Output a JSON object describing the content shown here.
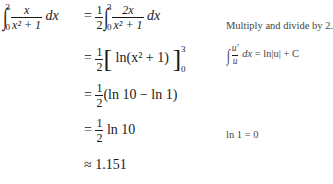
{
  "lines": [
    {
      "lhs": {
        "integral": {
          "lower": "0",
          "upper": "3",
          "numerator": "x",
          "denominator": "x² + 1",
          "differential": "dx"
        }
      },
      "rhs": {
        "relation": "=",
        "coef": {
          "numerator": "1",
          "denominator": "2"
        },
        "integral": {
          "lower": "0",
          "upper": "3",
          "numerator": "2x",
          "denominator": "x² + 1",
          "differential": "dx"
        }
      },
      "note": "Multiply and divide by 2."
    },
    {
      "rhs": {
        "relation": "=",
        "coef": {
          "numerator": "1",
          "denominator": "2"
        },
        "expr": "ln(x² + 1)",
        "lower": "0",
        "upper": "3"
      },
      "note": {
        "integral_num": "u′",
        "integral_den": "u",
        "differential": "dx",
        "result": "= ln|u| + C"
      }
    },
    {
      "rhs": {
        "relation": "=",
        "coef": {
          "numerator": "1",
          "denominator": "2"
        },
        "expr": "(ln 10 − ln 1)"
      }
    },
    {
      "rhs": {
        "relation": "=",
        "coef": {
          "numerator": "1",
          "denominator": "2"
        },
        "expr": "ln 10"
      },
      "note": "ln 1 = 0"
    },
    {
      "rhs": {
        "relation": "≈",
        "expr": "1.151"
      }
    }
  ]
}
